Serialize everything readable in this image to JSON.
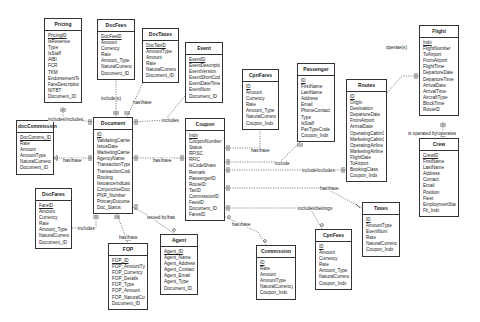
{
  "diagram": {
    "type": "entity-relationship",
    "entities": [
      {
        "id": "pricing",
        "name": "Pricing",
        "x": 44,
        "y": 18,
        "w": 38,
        "pk": "PricingID",
        "fields": [
          "PricingID",
          "IsRevenue",
          "Type",
          "IsStaff",
          "AIBI",
          "FCR",
          "TKM",
          "EndorsementTex",
          "FareDescription",
          "NITBT",
          "Document_ID"
        ]
      },
      {
        "id": "docfees",
        "name": "DocFees",
        "x": 97,
        "y": 19,
        "w": 38,
        "pk": "DocFeeID",
        "fields": [
          "DocFeeID",
          "Amount",
          "Currency",
          "Rate",
          "Amount_Type",
          "NaturalCurrency",
          "Document_ID"
        ]
      },
      {
        "id": "doctaxes",
        "name": "DocTaxes",
        "x": 142,
        "y": 28,
        "w": 37,
        "pk": "DocTaxID",
        "fields": [
          "DocTaxID",
          "AmountType",
          "Amount",
          "Rate",
          "NaturalCurrency",
          "Document_ID"
        ]
      },
      {
        "id": "event",
        "name": "Event",
        "x": 185,
        "y": 42,
        "w": 38,
        "pk": "EventID",
        "fields": [
          "EventID",
          "EventDescription",
          "EventVersion",
          "EventShortCode",
          "EventDateTime",
          "EventNum",
          "Document_ID"
        ]
      },
      {
        "id": "cpnfares",
        "name": "CpnFares",
        "x": 242,
        "y": 69,
        "w": 37,
        "pk": "ID",
        "fields": [
          "ID",
          "Amount",
          "Currency",
          "Rate",
          "Amount_Type",
          "NaturalCurrency",
          "Coupon_Indx"
        ]
      },
      {
        "id": "passenger",
        "name": "Passenger",
        "x": 297,
        "y": 63,
        "w": 38,
        "pk": "ID",
        "fields": [
          "ID",
          "FirstName",
          "LastName",
          "Address",
          "Email",
          "PhoneContact",
          "Type",
          "IsStaff",
          "PaxTypeCode",
          "Coupon_Indx"
        ]
      },
      {
        "id": "routes",
        "name": "Routes",
        "x": 346,
        "y": 79,
        "w": 41,
        "pk": "ID",
        "fields": [
          "ID",
          "Origin",
          "Destination",
          "DepartureDate",
          "FromAirport",
          "ArrivalDate",
          "OperatingCabinC",
          "MarketingCabinC",
          "OperatingAirline",
          "MarketingAirline",
          "FlightDate",
          "ToAirport",
          "BookingClass",
          "Coupon_Indx"
        ]
      },
      {
        "id": "flight",
        "name": "Flight",
        "x": 419,
        "y": 25,
        "w": 40,
        "pk": "Indx",
        "fields": [
          "Indx",
          "FlightNumber",
          "ToAirport",
          "FromAirport",
          "FlightTime",
          "DepartureDate",
          "DepartureTime",
          "ArrivalDate",
          "ArrivalTime",
          "AircraftType",
          "BlockTime",
          "RouteID"
        ]
      },
      {
        "id": "crew",
        "name": "Crew",
        "x": 419,
        "y": 138,
        "w": 40,
        "pk": "CrewID",
        "fields": [
          "CrewID",
          "FirstName",
          "LastName",
          "Address",
          "Contact",
          "Email",
          "Position",
          "Fleet",
          "EmploymentStart",
          "Flt_Indx"
        ]
      },
      {
        "id": "doccommission",
        "name": "docCommission",
        "x": 16,
        "y": 120,
        "w": 38,
        "pk": "DocComms_ID",
        "fields": [
          "DocComms_ID",
          "Rate",
          "Amount",
          "AmountType",
          "NaturalCurrency",
          "Document_ID"
        ]
      },
      {
        "id": "document",
        "name": "Document",
        "x": 93,
        "y": 117,
        "w": 40,
        "pk": "ID",
        "fields": [
          "ID",
          "ValidatingCarrier",
          "IssueDate",
          "MarketingCarrier",
          "AgencyName",
          "TransactionType",
          "TransactionCode",
          "Routing",
          "IssuanceIndicator",
          "ConjunctiveDocu",
          "PNR_Number",
          "PrimaryDocument",
          "Doc_Status"
        ]
      },
      {
        "id": "coupon",
        "name": "Coupon",
        "x": 185,
        "y": 118,
        "w": 40,
        "pk": "Indx",
        "fields": [
          "Indx",
          "CouponNumber",
          "Status",
          "RFISC",
          "RFIC",
          "IsCodeShare",
          "Remark",
          "PassengerID",
          "RouteID",
          "TaxID",
          "CommissionID",
          "FeesID",
          "Document_ID",
          "FaresID"
        ]
      },
      {
        "id": "docfares",
        "name": "DocFares",
        "x": 35,
        "y": 188,
        "w": 37,
        "pk": "FareID",
        "fields": [
          "FareID",
          "Amount",
          "Currency",
          "Rate",
          "Amount_Type",
          "NaturalCurrency",
          "Document_ID"
        ]
      },
      {
        "id": "taxes",
        "name": "Taxes",
        "x": 362,
        "y": 202,
        "w": 38,
        "pk": "ID",
        "fields": [
          "ID",
          "AmountType",
          "EventNum",
          "Rate",
          "NaturalCurrency",
          "Coupon_Indx"
        ]
      },
      {
        "id": "cpnfees",
        "name": "CpnFees",
        "x": 315,
        "y": 229,
        "w": 37,
        "pk": "ID",
        "fields": [
          "ID",
          "Amount",
          "Currency",
          "Rate",
          "Amount_Type",
          "NaturalCurrency",
          "Coupon_Indx"
        ]
      },
      {
        "id": "commission",
        "name": "Commission",
        "x": 256,
        "y": 245,
        "w": 40,
        "pk": "ID",
        "fields": [
          "ID",
          "Rate",
          "Amount",
          "AmountType",
          "NaturalCurrency",
          "Coupon_Indx"
        ]
      },
      {
        "id": "agent",
        "name": "Agent",
        "x": 160,
        "y": 234,
        "w": 38,
        "pk": "Agent_ID",
        "fields": [
          "Agent_ID",
          "Agent_Name",
          "Agent_Address",
          "Agent_Contact",
          "Agent_Email",
          "Agent_Type",
          "Document_ID"
        ]
      },
      {
        "id": "fop",
        "name": "FOP",
        "x": 108,
        "y": 243,
        "w": 40,
        "pk": "FOP_ID",
        "fields": [
          "FOP_ID",
          "FOP_AmountTyp",
          "FOP_Currency",
          "FOP_Details",
          "FOP_Type",
          "FOP_Amount",
          "FOP_NaturalCurr",
          "Document_ID"
        ]
      }
    ],
    "relationships": [
      {
        "from": "pricing",
        "to": "document",
        "label": "includes\\includes",
        "lx": 48,
        "ly": 117
      },
      {
        "from": "docfees",
        "to": "document",
        "label": "include(s)",
        "lx": 101,
        "ly": 96
      },
      {
        "from": "doctaxes",
        "to": "document",
        "label": "has\\have",
        "lx": 133,
        "ly": 100
      },
      {
        "from": "event",
        "to": "document",
        "label": "includes",
        "lx": 162,
        "ly": 118
      },
      {
        "from": "doccommission",
        "to": "document",
        "label": "has\\have",
        "lx": 63,
        "ly": 158
      },
      {
        "from": "docfares",
        "to": "document",
        "label": "includes",
        "lx": 78,
        "ly": 226
      },
      {
        "from": "document",
        "to": "coupon",
        "label": "has\\have",
        "lx": 153,
        "ly": 158
      },
      {
        "from": "document",
        "to": "fop",
        "label": "has\\have",
        "lx": 119,
        "ly": 235
      },
      {
        "from": "document",
        "to": "agent",
        "label": "issued by\\has",
        "lx": 147,
        "ly": 215
      },
      {
        "from": "cpnfares",
        "to": "coupon",
        "label": "has\\have",
        "lx": 251,
        "ly": 148
      },
      {
        "from": "passenger",
        "to": "coupon",
        "label": "include",
        "lx": 275,
        "ly": 161
      },
      {
        "from": "routes",
        "to": "coupon",
        "label": "include\\includes",
        "lx": 302,
        "ly": 168
      },
      {
        "from": "coupon",
        "to": "taxes",
        "label": "has\\have",
        "lx": 320,
        "ly": 186
      },
      {
        "from": "coupon",
        "to": "cpnfees",
        "label": "includes\\belongs",
        "lx": 298,
        "ly": 206
      },
      {
        "from": "coupon",
        "to": "commission",
        "label": "has\\have",
        "lx": 232,
        "ly": 222
      },
      {
        "from": "routes",
        "to": "flight",
        "label": "operate(s)",
        "lx": 386,
        "ly": 45
      },
      {
        "from": "flight",
        "to": "crew",
        "label": "is operated by\\operates",
        "lx": 408,
        "ly": 131
      }
    ]
  }
}
